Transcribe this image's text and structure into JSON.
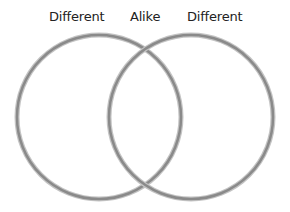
{
  "diagram": {
    "type": "venn",
    "labels": {
      "left": "Different",
      "center": "Alike",
      "right": "Different"
    },
    "circles": [
      {
        "name": "left-circle",
        "cx": 99,
        "cy": 117,
        "r": 82
      },
      {
        "name": "right-circle",
        "cx": 191,
        "cy": 117,
        "r": 82
      }
    ],
    "colors": {
      "stroke": "#8a8a8a",
      "stroke_shadow": "#b8b8b8",
      "text": "#222222",
      "background": "#ffffff"
    }
  }
}
